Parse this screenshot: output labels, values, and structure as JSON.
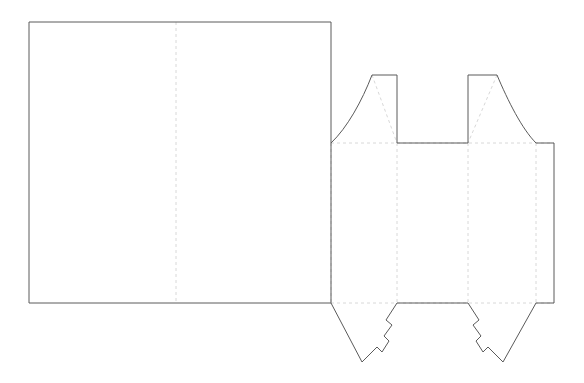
{
  "document": {
    "title": "Packaging Dieline",
    "type": "die-cut-template",
    "width": 584,
    "height": 383,
    "background_color": "#ffffff",
    "units": "px"
  },
  "styles": {
    "cut_line_color": "#5a5a5a",
    "cut_line_width": 1,
    "fold_line_color": "#d8d8d8",
    "fold_line_width": 1,
    "fold_dash_pattern": "3 3"
  },
  "geometry": {
    "main_panel": {
      "label": "main-front-panel",
      "left": 29,
      "top": 22,
      "right": 331,
      "bottom": 303,
      "outline": "M 29 22 L 331 22 L 331 303 L 29 303 Z"
    },
    "fold_lines": {
      "vertical": [
        {
          "label": "panel-center-fold",
          "x": 176,
          "y1": 22,
          "y2": 303
        },
        {
          "label": "body-fold-1",
          "x": 331,
          "y1": 143,
          "y2": 303
        },
        {
          "label": "body-fold-2",
          "x": 397,
          "y1": 143,
          "y2": 303
        },
        {
          "label": "body-fold-3",
          "x": 468,
          "y1": 143,
          "y2": 303
        },
        {
          "label": "body-fold-4",
          "x": 536,
          "y1": 143,
          "y2": 303
        }
      ],
      "horizontal": [
        {
          "label": "top-score-line",
          "x1": 331,
          "y1": 143,
          "x2": 554,
          "y2": 143
        },
        {
          "label": "bottom-score-line",
          "x1": 331,
          "y1": 303,
          "x2": 554,
          "y2": 303
        }
      ],
      "diagonal": [
        {
          "label": "top-flap-1-diagonal",
          "x1": 372,
          "y1": 75,
          "x2": 397,
          "y2": 143
        },
        {
          "label": "top-flap-2-diagonal",
          "x1": 497,
          "y1": 75,
          "x2": 468,
          "y2": 143
        },
        {
          "label": "bottom-flap-1-diagonal",
          "x1": 331,
          "y1": 303,
          "x2": 397,
          "y2": 303
        },
        {
          "label": "bottom-flap-2-diagonal",
          "x1": 468,
          "y1": 303,
          "x2": 536,
          "y2": 303
        }
      ]
    },
    "top_profile": {
      "label": "top-flaps-and-notch-outline",
      "path": "M 331 143 C 347 128 362 101 372 75 L 397 75 L 397 143 L 468 143 L 468 75 L 497 75 C 508 101 522 129 536 143 L 554 143"
    },
    "right_edge": {
      "label": "right-glue-tab-edge",
      "path": "M 554 143 L 554 303"
    },
    "bottom_profile": {
      "label": "bottom-tuck-flaps-outline",
      "path": "M 331 303 L 362 362 L 377 347 L 382 352 L 389 341 L 384 336 L 392 325 L 386 320 L 397 303 L 468 303 L 479 320 L 473 325 L 481 336 L 476 341 L 483 352 L 488 347 L 503 362 L 536 303 L 554 303"
    },
    "flaps": [
      {
        "label": "top-flap-left",
        "x1": 331,
        "x2": 397,
        "top_y": 75,
        "base_y": 143,
        "shape": "curved-shoulder"
      },
      {
        "label": "top-notch-center",
        "x1": 397,
        "x2": 468,
        "top_y": 143,
        "base_y": 143,
        "shape": "rectangular-cutout"
      },
      {
        "label": "top-flap-right",
        "x1": 468,
        "x2": 536,
        "top_y": 75,
        "base_y": 143,
        "shape": "curved-shoulder"
      },
      {
        "label": "bottom-tuck-left",
        "x1": 331,
        "x2": 397,
        "tip_y": 362,
        "base_y": 303,
        "shape": "pointed-lock-tab"
      },
      {
        "label": "bottom-tuck-right",
        "x1": 468,
        "x2": 536,
        "tip_y": 362,
        "base_y": 303,
        "shape": "pointed-lock-tab"
      }
    ]
  }
}
